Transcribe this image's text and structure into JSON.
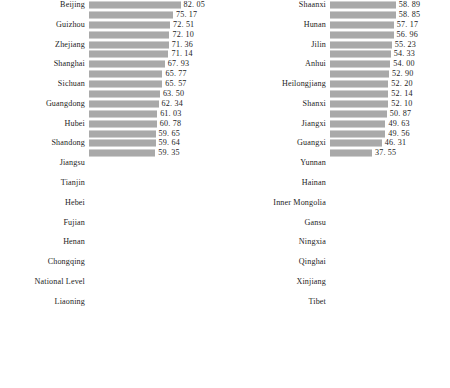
{
  "figure": {
    "caption": ""
  },
  "chart_data": {
    "type": "bar",
    "orientation": "horizontal",
    "title": "",
    "xlabel": "",
    "ylabel": "",
    "grid": false,
    "legend": null,
    "xlim": [
      0,
      86
    ],
    "label_interval": 2,
    "note": "Two stacked panels of a single ranked horizontal bar chart; category names are printed on every other bar.",
    "panels": [
      {
        "name": "left-panel",
        "categories": [
          "Beijing",
          "",
          "Guizhou",
          "",
          "Zhejiang",
          "",
          "Shanghai",
          "",
          "Sichuan",
          "",
          "Guangdong",
          "",
          "Hubei",
          "",
          "Shandong",
          "",
          "Jiangsu",
          ""
        ],
        "visible_labels": [
          "Beijing",
          "Guizhou",
          "Zhejiang",
          "Shanghai",
          "Sichuan",
          "Guangdong",
          "Hubei",
          "Shandong",
          "Jiangsu",
          "Tianjin",
          "Hebei",
          "Fujian",
          "Henan",
          "Chongqing",
          "National Level",
          "Liaoning"
        ],
        "values": [
          82.05,
          75.17,
          72.51,
          72.1,
          71.36,
          71.14,
          67.93,
          65.77,
          65.57,
          63.5,
          62.34,
          61.03,
          60.78,
          59.65,
          59.64,
          59.35
        ]
      },
      {
        "name": "right-panel",
        "visible_labels": [
          "Shaanxi",
          "Hunan",
          "Jilin",
          "Anhui",
          "Heilongjiang",
          "Shanxi",
          "Jiangxi",
          "Guangxi",
          "Yunnan",
          "Hainan",
          "Inner Mongolia",
          "Gansu",
          "Ningxia",
          "Qinghai",
          "Xinjiang",
          "Tibet"
        ],
        "values": [
          58.89,
          58.85,
          57.17,
          56.96,
          55.23,
          54.33,
          54.0,
          52.9,
          52.2,
          52.14,
          52.1,
          50.87,
          49.63,
          49.56,
          46.31,
          37.55
        ]
      }
    ]
  },
  "left_panel": {
    "rows": [
      {
        "label": "Beijing",
        "value": "82. 05",
        "v": 82.05
      },
      {
        "label": "",
        "value": "75. 17",
        "v": 75.17
      },
      {
        "label": "Guizhou",
        "value": "72. 51",
        "v": 72.51
      },
      {
        "label": "",
        "value": "72. 10",
        "v": 72.1
      },
      {
        "label": "Zhejiang",
        "value": "71. 36",
        "v": 71.36
      },
      {
        "label": "",
        "value": "71. 14",
        "v": 71.14
      },
      {
        "label": "Shanghai",
        "value": "67. 93",
        "v": 67.93
      },
      {
        "label": "",
        "value": "65. 77",
        "v": 65.77
      },
      {
        "label": "Sichuan",
        "value": "65. 57",
        "v": 65.57
      },
      {
        "label": "",
        "value": "63. 50",
        "v": 63.5
      },
      {
        "label": "Guangdong",
        "value": "62. 34",
        "v": 62.34
      },
      {
        "label": "",
        "value": "61. 03",
        "v": 61.03
      },
      {
        "label": "Hubei",
        "value": "60. 78",
        "v": 60.78
      },
      {
        "label": "",
        "value": "59. 65",
        "v": 59.65
      },
      {
        "label": "Shandong",
        "value": "59. 64",
        "v": 59.64
      },
      {
        "label": "",
        "value": "59. 35",
        "v": 59.35
      },
      {
        "label": "Jiangsu",
        "value": "",
        "v": 0
      },
      {
        "label": "",
        "value": "",
        "v": 0
      },
      {
        "label": "Tianjin",
        "value": "",
        "v": 0
      },
      {
        "label": "",
        "value": "",
        "v": 0
      },
      {
        "label": "Hebei",
        "value": "",
        "v": 0
      },
      {
        "label": "",
        "value": "",
        "v": 0
      },
      {
        "label": "Fujian",
        "value": "",
        "v": 0
      },
      {
        "label": "",
        "value": "",
        "v": 0
      },
      {
        "label": "Henan",
        "value": "",
        "v": 0
      },
      {
        "label": "",
        "value": "",
        "v": 0
      },
      {
        "label": "Chongqing",
        "value": "",
        "v": 0
      },
      {
        "label": "",
        "value": "",
        "v": 0
      },
      {
        "label": "National Level",
        "value": "",
        "v": 0
      },
      {
        "label": "",
        "value": "",
        "v": 0
      },
      {
        "label": "Liaoning",
        "value": "",
        "v": 0
      },
      {
        "label": "",
        "value": "",
        "v": 0
      }
    ]
  },
  "right_panel": {
    "rows": [
      {
        "label": "Shaanxi",
        "value": "58. 89",
        "v": 58.89
      },
      {
        "label": "",
        "value": "58. 85",
        "v": 58.85
      },
      {
        "label": "Hunan",
        "value": "57. 17",
        "v": 57.17
      },
      {
        "label": "",
        "value": "56. 96",
        "v": 56.96
      },
      {
        "label": "Jilin",
        "value": "55. 23",
        "v": 55.23
      },
      {
        "label": "",
        "value": "54. 33",
        "v": 54.33
      },
      {
        "label": "Anhui",
        "value": "54. 00",
        "v": 54.0
      },
      {
        "label": "",
        "value": "52. 90",
        "v": 52.9
      },
      {
        "label": "Heilongjiang",
        "value": "52. 20",
        "v": 52.2
      },
      {
        "label": "",
        "value": "52. 14",
        "v": 52.14
      },
      {
        "label": "Shanxi",
        "value": "52. 10",
        "v": 52.1
      },
      {
        "label": "",
        "value": "50. 87",
        "v": 50.87
      },
      {
        "label": "Jiangxi",
        "value": "49. 63",
        "v": 49.63
      },
      {
        "label": "",
        "value": "49. 56",
        "v": 49.56
      },
      {
        "label": "Guangxi",
        "value": "46. 31",
        "v": 46.31
      },
      {
        "label": "",
        "value": "37. 55",
        "v": 37.55
      },
      {
        "label": "Yunnan",
        "value": "",
        "v": 0
      },
      {
        "label": "",
        "value": "",
        "v": 0
      },
      {
        "label": "Hainan",
        "value": "",
        "v": 0
      },
      {
        "label": "",
        "value": "",
        "v": 0
      },
      {
        "label": "Inner Mongolia",
        "value": "",
        "v": 0
      },
      {
        "label": "",
        "value": "",
        "v": 0
      },
      {
        "label": "Gansu",
        "value": "",
        "v": 0
      },
      {
        "label": "",
        "value": "",
        "v": 0
      },
      {
        "label": "Ningxia",
        "value": "",
        "v": 0
      },
      {
        "label": "",
        "value": "",
        "v": 0
      },
      {
        "label": "Qinghai",
        "value": "",
        "v": 0
      },
      {
        "label": "",
        "value": "",
        "v": 0
      },
      {
        "label": "Xinjiang",
        "value": "",
        "v": 0
      },
      {
        "label": "",
        "value": "",
        "v": 0
      },
      {
        "label": "Tibet",
        "value": "",
        "v": 0
      },
      {
        "label": "",
        "value": "",
        "v": 0
      }
    ]
  },
  "scale": {
    "max_value": 86.0,
    "left_track_px": 96,
    "right_track_px": 96
  }
}
